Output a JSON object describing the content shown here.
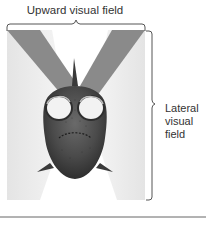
{
  "diagram": {
    "labels": {
      "upward": "Upward visual field",
      "lateral_line1": "Lateral",
      "lateral_line2": "visual",
      "lateral_line3": "field"
    },
    "colors": {
      "upward_field": "#8a8a8a",
      "lateral_field": "#ececec",
      "fish_body": "#4a4a4a",
      "brace": "#555555",
      "rule": "#666666",
      "text": "#333333"
    },
    "elements": [
      "upward-visual-field-bands",
      "lateral-visual-field-cones",
      "fish-head-frontal",
      "top-brace",
      "right-brace",
      "bottom-rule"
    ]
  }
}
